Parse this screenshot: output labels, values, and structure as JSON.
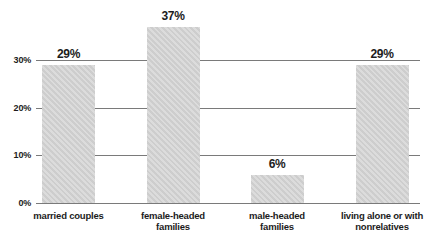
{
  "chart_data": {
    "type": "bar",
    "title": "",
    "xlabel": "",
    "ylabel": "",
    "categories": [
      "married couples",
      "female-headed\nfamilies",
      "male-headed\nfamilies",
      "living alone or with\nnonrelatives"
    ],
    "values": [
      29,
      37,
      6,
      29
    ],
    "value_labels": [
      "29%",
      "37%",
      "6%",
      "29%"
    ],
    "yticks": [
      0,
      10,
      20,
      30
    ],
    "ytick_labels": [
      "0%",
      "10%",
      "20%",
      "30%"
    ],
    "ylim": [
      0,
      40
    ],
    "grid": true,
    "legend": false,
    "colors": {
      "bar_fill": "#d4d4d4",
      "gridline": "#7a7a7a",
      "text": "#1c1c1c",
      "background": "#ffffff"
    }
  }
}
